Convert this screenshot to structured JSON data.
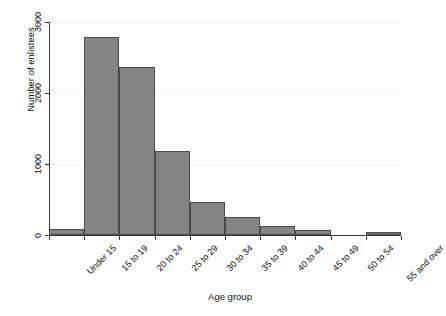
{
  "chart_data": {
    "type": "bar",
    "title": "",
    "xlabel": "Age group",
    "ylabel": "Number of enlistees",
    "categories": [
      "Under 15",
      "15 to 19",
      "20 to 24",
      "25 to 29",
      "30 to 34",
      "35 to 39",
      "40 to 44",
      "45 to 49",
      "50 to 54",
      "55 and over"
    ],
    "values": [
      85,
      2790,
      2360,
      1180,
      470,
      250,
      120,
      70,
      0,
      40
    ],
    "ylim": [
      0,
      3000
    ],
    "yticks": [
      0,
      1000,
      2000,
      3000
    ],
    "ytick_labels": [
      "0",
      "1000",
      "2000",
      "3000"
    ],
    "grid": true,
    "legend": null,
    "bar_color": "#848484",
    "bar_edge_color": "#4a4a4a",
    "axis_color": "#3a3a3a",
    "background_color": "#fdfdfb"
  }
}
